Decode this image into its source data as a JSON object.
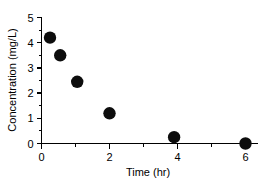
{
  "chart_data": {
    "type": "scatter",
    "title": "",
    "xlabel": "Time (hr)",
    "ylabel": "Concentration (mg/L)",
    "xlim": [
      0,
      6.4
    ],
    "ylim": [
      0,
      5
    ],
    "grid": false,
    "legend": null,
    "x_ticks": [
      0,
      2,
      4,
      6
    ],
    "x_tick_labels": [
      "0",
      "2",
      "4",
      "6"
    ],
    "x_minor_ticks": [
      1,
      3,
      5
    ],
    "y_ticks": [
      0,
      1,
      2,
      3,
      4,
      5
    ],
    "y_tick_labels": [
      "0",
      "1",
      "2",
      "3",
      "4",
      "5"
    ],
    "y_minor_ticks": [
      0.5,
      1.5,
      2.5,
      3.5,
      4.5
    ],
    "marker": "filled-circle",
    "marker_color": "#0d0d0d",
    "x": [
      0.25,
      0.55,
      1.05,
      2.0,
      3.9,
      6.0
    ],
    "values": [
      4.2,
      3.5,
      2.45,
      1.2,
      0.25,
      0.0
    ],
    "points": [
      {
        "x": 0.25,
        "y": 4.2
      },
      {
        "x": 0.55,
        "y": 3.5
      },
      {
        "x": 1.05,
        "y": 2.45
      },
      {
        "x": 2.0,
        "y": 1.2
      },
      {
        "x": 3.9,
        "y": 0.25
      },
      {
        "x": 6.0,
        "y": 0.0
      }
    ]
  }
}
